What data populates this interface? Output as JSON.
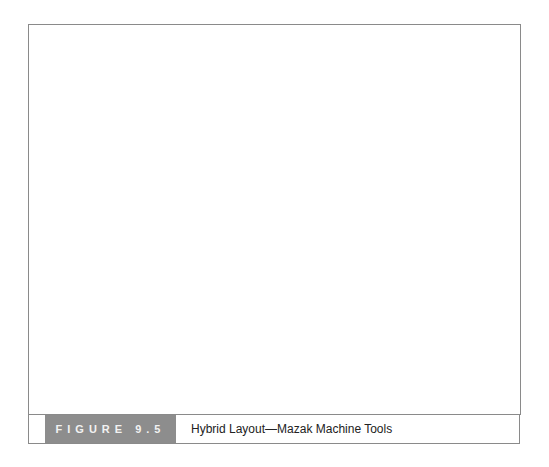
{
  "figure": {
    "number_label": "FIGURE 9.5",
    "title": "Hybrid Layout—Mazak Machine Tools",
    "colors": {
      "panel_bg": "#bdbdbd",
      "box_border": "#6c6c6c",
      "caption_tag_bg": "#8c8c8c",
      "caption_tag_text": "#f2f2f2",
      "arrow": "#1a1a1a"
    }
  },
  "diagram": {
    "fixed_position_assemblies": [
      {
        "lines": [
          "Fixed",
          "Position",
          "Assembly"
        ]
      },
      {
        "lines": [
          "Fixed",
          "Position",
          "Assembly"
        ]
      },
      {
        "lines": [
          "Fixed",
          "Position",
          "Assembly"
        ]
      },
      {
        "lines": [
          "Fixed",
          "Position",
          "Assembly"
        ]
      },
      {
        "lines": [
          "Fixed",
          "Position",
          "Assembly"
        ]
      },
      {
        "lines": [
          "Fixed",
          "Position",
          "Assembly"
        ]
      },
      {
        "lines": [
          "Fixed",
          "Position",
          "Assembly"
        ]
      }
    ],
    "asrs": {
      "lines": [
        "Component",
        "Part",
        "Automated",
        "Storage",
        "and",
        "Retrevial",
        "System"
      ]
    },
    "centers": {
      "a": {
        "lines": [
          "Flexible Manufacturing Center \"A\""
        ]
      },
      "b": {
        "lines": [
          "Flexible",
          "Manufacturing",
          "Center",
          "\"B\""
        ]
      },
      "c": {
        "lines": [
          "Cellular",
          "Manufacturing",
          "Center",
          "\"C\""
        ]
      },
      "d": {
        "lines": [
          "Cellular",
          "Mfg",
          "Center",
          "\"D\""
        ]
      },
      "e": {
        "lines": [
          "Job Shop",
          "Mfg",
          "Center",
          "\"E\""
        ]
      },
      "f": {
        "lines": [
          "Cellular",
          "Manufacturing",
          "Center",
          "\"F\""
        ]
      }
    }
  }
}
